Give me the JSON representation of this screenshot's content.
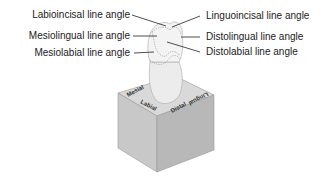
{
  "diagram": {
    "labels_left": [
      {
        "text": "Labioincisal line angle"
      },
      {
        "text": "Mesiolingual line angle"
      },
      {
        "text": "Mesiolabial line angle"
      }
    ],
    "labels_right": [
      {
        "text": "Linguoincisal line angle"
      },
      {
        "text": "Distolingual line angle"
      },
      {
        "text": "Distolabial line angle"
      }
    ],
    "cube_faces": {
      "mesial": "Mesial",
      "lingual": "Lingual",
      "labial": "Labial",
      "distal": "Distal"
    },
    "colors": {
      "cube_top": "#d9d9d9",
      "cube_left": "#c4c4c4",
      "cube_right": "#b3b3b3",
      "tooth": "#efefef",
      "line": "#222222"
    }
  }
}
